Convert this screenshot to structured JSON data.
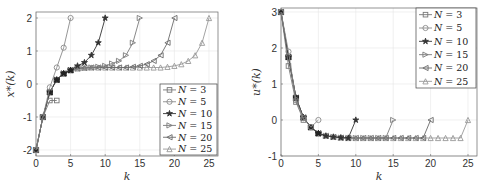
{
  "chart_data": [
    {
      "type": "line",
      "title": "",
      "xlabel": "k",
      "ylabel": "x*(k)",
      "xlim": [
        0,
        26
      ],
      "ylim": [
        -2.2,
        2.2
      ],
      "xticks": [
        0,
        5,
        10,
        15,
        20,
        25
      ],
      "yticks": [
        -2,
        -1,
        0,
        1,
        2
      ],
      "grid": true,
      "legend_position": "lower right",
      "series": [
        {
          "name": "N = 3",
          "marker": "square",
          "x": [
            0,
            1,
            2,
            3
          ],
          "values": [
            -2,
            -1,
            -0.5,
            -0.5
          ]
        },
        {
          "name": "N = 5",
          "marker": "circle",
          "x": [
            0,
            1,
            2,
            3,
            4,
            5
          ],
          "values": [
            -2,
            -1,
            -0.1,
            0.5,
            1.1,
            2
          ]
        },
        {
          "name": "N = 10",
          "marker": "star",
          "x": [
            0,
            1,
            2,
            3,
            4,
            5,
            6,
            7,
            8,
            9,
            10
          ],
          "values": [
            -2,
            -1,
            -0.25,
            0.13,
            0.32,
            0.42,
            0.55,
            0.65,
            0.87,
            1.25,
            2
          ]
        },
        {
          "name": "N = 15",
          "marker": "triangle-right",
          "x": [
            0,
            1,
            2,
            3,
            4,
            5,
            6,
            7,
            8,
            9,
            10,
            11,
            12,
            13,
            14,
            15
          ],
          "values": [
            -2,
            -1,
            -0.25,
            0.13,
            0.32,
            0.42,
            0.47,
            0.49,
            0.5,
            0.52,
            0.55,
            0.62,
            0.7,
            0.87,
            1.25,
            2
          ]
        },
        {
          "name": "N = 20",
          "marker": "triangle-left",
          "x": [
            0,
            1,
            2,
            3,
            4,
            5,
            6,
            7,
            8,
            9,
            10,
            11,
            12,
            13,
            14,
            15,
            16,
            17,
            18,
            19,
            20
          ],
          "values": [
            -2,
            -1,
            -0.25,
            0.13,
            0.32,
            0.42,
            0.47,
            0.49,
            0.5,
            0.5,
            0.5,
            0.5,
            0.5,
            0.5,
            0.52,
            0.55,
            0.6,
            0.7,
            0.87,
            1.25,
            2
          ]
        },
        {
          "name": "N = 25",
          "marker": "triangle-up",
          "x": [
            0,
            1,
            2,
            3,
            4,
            5,
            6,
            7,
            8,
            9,
            10,
            11,
            12,
            13,
            14,
            15,
            16,
            17,
            18,
            19,
            20,
            21,
            22,
            23,
            24,
            25
          ],
          "values": [
            -2,
            -1,
            -0.25,
            0.13,
            0.32,
            0.42,
            0.47,
            0.49,
            0.5,
            0.5,
            0.5,
            0.5,
            0.5,
            0.5,
            0.5,
            0.5,
            0.5,
            0.5,
            0.5,
            0.52,
            0.55,
            0.6,
            0.7,
            0.87,
            1.25,
            2
          ]
        }
      ]
    },
    {
      "type": "line",
      "title": "",
      "xlabel": "k",
      "ylabel": "u*(k)",
      "xlim": [
        0,
        26
      ],
      "ylim": [
        -1,
        3
      ],
      "xticks": [
        0,
        5,
        10,
        15,
        20,
        25
      ],
      "yticks": [
        -1,
        0,
        1,
        2,
        3
      ],
      "grid": true,
      "legend_position": "upper right",
      "series": [
        {
          "name": "N = 3",
          "marker": "square",
          "x": [
            0,
            1,
            2,
            3
          ],
          "values": [
            3,
            1.5,
            0.5,
            0
          ]
        },
        {
          "name": "N = 5",
          "marker": "circle",
          "x": [
            0,
            1,
            2,
            3,
            4,
            5
          ],
          "values": [
            3,
            1.9,
            0.55,
            0.05,
            -0.2,
            0
          ]
        },
        {
          "name": "N = 10",
          "marker": "star",
          "x": [
            0,
            1,
            2,
            3,
            4,
            5,
            6,
            7,
            8,
            9,
            10
          ],
          "values": [
            3,
            1.75,
            0.62,
            0.07,
            -0.2,
            -0.37,
            -0.44,
            -0.47,
            -0.49,
            -0.5,
            0
          ]
        },
        {
          "name": "N = 15",
          "marker": "triangle-right",
          "x": [
            0,
            1,
            2,
            3,
            4,
            5,
            6,
            7,
            8,
            9,
            10,
            11,
            12,
            13,
            14,
            15
          ],
          "values": [
            3,
            1.75,
            0.62,
            0.07,
            -0.2,
            -0.37,
            -0.44,
            -0.47,
            -0.49,
            -0.5,
            -0.5,
            -0.5,
            -0.5,
            -0.5,
            -0.5,
            0
          ]
        },
        {
          "name": "N = 20",
          "marker": "triangle-left",
          "x": [
            0,
            1,
            2,
            3,
            4,
            5,
            6,
            7,
            8,
            9,
            10,
            11,
            12,
            13,
            14,
            15,
            16,
            17,
            18,
            19,
            20
          ],
          "values": [
            3,
            1.75,
            0.62,
            0.07,
            -0.2,
            -0.37,
            -0.44,
            -0.47,
            -0.49,
            -0.5,
            -0.5,
            -0.5,
            -0.5,
            -0.5,
            -0.5,
            -0.5,
            -0.5,
            -0.5,
            -0.5,
            -0.5,
            0
          ]
        },
        {
          "name": "N = 25",
          "marker": "triangle-up",
          "x": [
            0,
            1,
            2,
            3,
            4,
            5,
            6,
            7,
            8,
            9,
            10,
            11,
            12,
            13,
            14,
            15,
            16,
            17,
            18,
            19,
            20,
            21,
            22,
            23,
            24,
            25
          ],
          "values": [
            3,
            1.75,
            0.62,
            0.07,
            -0.2,
            -0.37,
            -0.44,
            -0.47,
            -0.49,
            -0.5,
            -0.5,
            -0.5,
            -0.5,
            -0.5,
            -0.5,
            -0.5,
            -0.5,
            -0.5,
            -0.5,
            -0.5,
            -0.5,
            -0.5,
            -0.5,
            -0.5,
            -0.5,
            0
          ]
        }
      ]
    }
  ],
  "legend_labels": [
    "N = 3",
    "N = 5",
    "N = 10",
    "N = 15",
    "N = 20",
    "N = 25"
  ],
  "colors": {
    "axis": "#555555",
    "grid": "#e6e6e6",
    "series": [
      "#777777",
      "#8a8a8a",
      "#333333",
      "#7a7a7a",
      "#6a6a6a",
      "#999999"
    ],
    "dark_overlap": "#222222"
  }
}
